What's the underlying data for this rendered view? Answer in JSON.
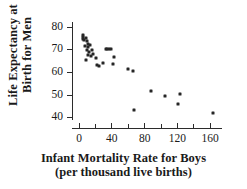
{
  "chart_data": {
    "type": "scatter",
    "title": "",
    "xlabel": "Infant Mortality Rate for Boys",
    "xlabel_sub": "(per thousand live births)",
    "ylabel_line1": "Life Expectancy at",
    "ylabel_line2": "Birth for Men",
    "xlim": [
      -8,
      175
    ],
    "ylim": [
      38,
      82
    ],
    "xticks": [
      0,
      40,
      80,
      120,
      160
    ],
    "xticks_minor": [
      20,
      60,
      100,
      140
    ],
    "yticks": [
      40,
      50,
      60,
      70,
      80
    ],
    "xtick_labels": [
      "0",
      "40",
      "80",
      "120",
      "160"
    ],
    "ytick_labels": [
      "40",
      "50",
      "60",
      "70",
      "80"
    ],
    "grid": false,
    "legend": false,
    "marker_color": "#262626",
    "axis_color": "#2b2b2b",
    "points": [
      {
        "x": 5,
        "y": 76.5
      },
      {
        "x": 6,
        "y": 75.5
      },
      {
        "x": 6,
        "y": 74.5
      },
      {
        "x": 7,
        "y": 74.0
      },
      {
        "x": 9,
        "y": 75.0
      },
      {
        "x": 10,
        "y": 73.5
      },
      {
        "x": 11,
        "y": 72.5
      },
      {
        "x": 8,
        "y": 71.5
      },
      {
        "x": 12,
        "y": 71.0
      },
      {
        "x": 14,
        "y": 72.0
      },
      {
        "x": 10,
        "y": 69.5
      },
      {
        "x": 13,
        "y": 69.0
      },
      {
        "x": 16,
        "y": 69.5
      },
      {
        "x": 12,
        "y": 67.5
      },
      {
        "x": 15,
        "y": 67.0
      },
      {
        "x": 18,
        "y": 68.0
      },
      {
        "x": 9,
        "y": 65.5
      },
      {
        "x": 21,
        "y": 66.0
      },
      {
        "x": 33,
        "y": 70.0
      },
      {
        "x": 35,
        "y": 70.0
      },
      {
        "x": 37,
        "y": 70.0
      },
      {
        "x": 39,
        "y": 70.0
      },
      {
        "x": 23,
        "y": 63.0
      },
      {
        "x": 25,
        "y": 62.5
      },
      {
        "x": 30,
        "y": 64.0
      },
      {
        "x": 43,
        "y": 66.5
      },
      {
        "x": 42,
        "y": 63.5
      },
      {
        "x": 60,
        "y": 61.5
      },
      {
        "x": 66,
        "y": 60.5
      },
      {
        "x": 68,
        "y": 43.5
      },
      {
        "x": 88,
        "y": 51.5
      },
      {
        "x": 106,
        "y": 49.5
      },
      {
        "x": 121,
        "y": 46.0
      },
      {
        "x": 124,
        "y": 50.5
      },
      {
        "x": 164,
        "y": 42.0
      }
    ]
  }
}
